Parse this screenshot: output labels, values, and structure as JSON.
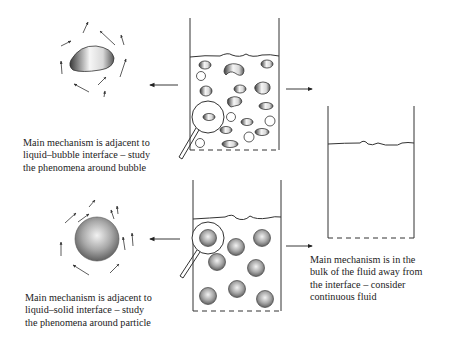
{
  "diagram": {
    "captions": {
      "bubble": [
        "Main mechanism is adjacent to",
        "liquid–bubble interface – study",
        "the phenomena around bubble"
      ],
      "particle": [
        "Main mechanism is adjacent to",
        "liquid–solid interface – study",
        "the phenomena around particle"
      ],
      "bulk": [
        "Main mechanism is in the",
        "bulk of the fluid away from",
        "the interface – consider",
        "continuous fluid"
      ]
    },
    "elements": {
      "bubble_container": "beaker with liquid and dispersed bubbles, magnifier on one bubble",
      "particle_container": "beaker with liquid and dispersed solid particles, magnifier on one particle",
      "continuous_container": "beaker with liquid only",
      "bubble_detail": "single bubble with surrounding flow arrows",
      "particle_detail": "single spherical particle with surrounding flow arrows"
    },
    "colors": {
      "line": "#333333",
      "shade_dark": "#555555",
      "shade_light": "#f4f4f4"
    }
  }
}
